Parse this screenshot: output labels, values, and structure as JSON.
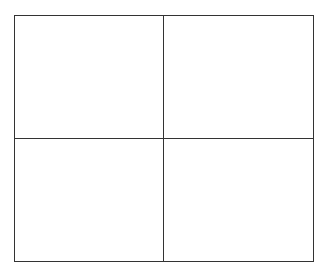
{
  "diagram": {
    "type": "2x2 grid",
    "rows": 2,
    "columns": 2,
    "line_color": "#333333",
    "background_color": "#ffffff",
    "cells": [
      {
        "position": "top-left",
        "label": ""
      },
      {
        "position": "top-right",
        "label": ""
      },
      {
        "position": "bottom-left",
        "label": ""
      },
      {
        "position": "bottom-right",
        "label": ""
      }
    ]
  }
}
